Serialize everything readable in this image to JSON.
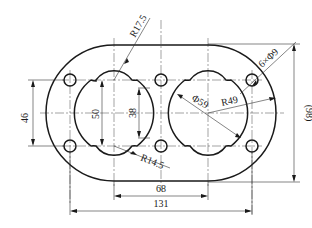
{
  "drawing": {
    "title": "Flange plate with two lobed bores",
    "line_color": "#1a1a1a",
    "background": "#ffffff"
  },
  "dimensions": {
    "r17_5": "R17.5",
    "hole_callout": "6×Φ9",
    "bore_dia": "Φ59",
    "r49": "R49",
    "r14_5": "R14.5",
    "overall_height": "(98)",
    "hole_spacing_v": "46",
    "bore_height": "50",
    "neck_height": "38",
    "center_distance": "68",
    "overall_width": "131"
  }
}
